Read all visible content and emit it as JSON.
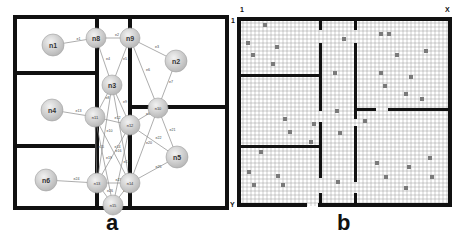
{
  "panels": [
    {
      "id": "a",
      "caption": "a",
      "type": "graph-floorplan",
      "nodes": [
        {
          "id": "n1",
          "label": "n1",
          "x": 53,
          "y": 45,
          "r": 11
        },
        {
          "id": "d1",
          "label": "n8",
          "x": 96,
          "y": 38,
          "r": 10
        },
        {
          "id": "d2",
          "label": "n9",
          "x": 130,
          "y": 38,
          "r": 10
        },
        {
          "id": "n2",
          "label": "n2",
          "x": 176,
          "y": 61,
          "r": 11
        },
        {
          "id": "n3",
          "label": "n3",
          "x": 112,
          "y": 85,
          "r": 10
        },
        {
          "id": "n4",
          "label": "n4",
          "x": 52,
          "y": 110,
          "r": 11
        },
        {
          "id": "d3",
          "label": "n11",
          "x": 95,
          "y": 117,
          "r": 10
        },
        {
          "id": "d4",
          "label": "n12",
          "x": 130,
          "y": 125,
          "r": 10
        },
        {
          "id": "d5",
          "label": "n10",
          "x": 158,
          "y": 108,
          "r": 10
        },
        {
          "id": "n5",
          "label": "n5",
          "x": 177,
          "y": 157,
          "r": 11
        },
        {
          "id": "n6",
          "label": "n6",
          "x": 46,
          "y": 180,
          "r": 11
        },
        {
          "id": "d6",
          "label": "n13",
          "x": 97,
          "y": 183,
          "r": 10
        },
        {
          "id": "d7",
          "label": "n14",
          "x": 130,
          "y": 183,
          "r": 10
        },
        {
          "id": "d8",
          "label": "n15",
          "x": 113,
          "y": 205,
          "r": 10
        }
      ],
      "edges": [
        {
          "from": "n1",
          "to": "d1",
          "label": "e1"
        },
        {
          "from": "d1",
          "to": "d2",
          "label": "e2"
        },
        {
          "from": "d2",
          "to": "n2",
          "label": "e3"
        },
        {
          "from": "d1",
          "to": "n3",
          "label": "e4"
        },
        {
          "from": "d2",
          "to": "n3",
          "label": "e5"
        },
        {
          "from": "d2",
          "to": "d5",
          "label": "e6"
        },
        {
          "from": "n2",
          "to": "d5",
          "label": "e7"
        },
        {
          "from": "n3",
          "to": "d3",
          "label": "e8"
        },
        {
          "from": "n3",
          "to": "d4",
          "label": "e9"
        },
        {
          "from": "n3",
          "to": "d6",
          "label": "e10"
        },
        {
          "from": "n3",
          "to": "d7",
          "label": "e11"
        },
        {
          "from": "d3",
          "to": "d4",
          "label": "e12"
        },
        {
          "from": "n4",
          "to": "d3",
          "label": "e13"
        },
        {
          "from": "d3",
          "to": "d7",
          "label": "e14"
        },
        {
          "from": "d3",
          "to": "d6",
          "label": "e15"
        },
        {
          "from": "d4",
          "to": "d6",
          "label": "e16"
        },
        {
          "from": "d4",
          "to": "d8",
          "label": "e17"
        },
        {
          "from": "d5",
          "to": "d4",
          "label": "e18"
        },
        {
          "from": "d5",
          "to": "n5",
          "label": "e21"
        },
        {
          "from": "d5",
          "to": "d7",
          "label": "e20"
        },
        {
          "from": "d4",
          "to": "n5",
          "label": "e22"
        },
        {
          "from": "d3",
          "to": "d8",
          "label": "e19"
        },
        {
          "from": "n6",
          "to": "d6",
          "label": "e24"
        },
        {
          "from": "d6",
          "to": "d7",
          "label": "e23"
        },
        {
          "from": "n5",
          "to": "d7",
          "label": "e25"
        },
        {
          "from": "d6",
          "to": "d8",
          "label": "e26"
        },
        {
          "from": "d7",
          "to": "d8",
          "label": "e27"
        }
      ],
      "walls": [
        {
          "x1": 15,
          "y1": 17,
          "x2": 227,
          "y2": 17
        },
        {
          "x1": 227,
          "y1": 17,
          "x2": 227,
          "y2": 208
        },
        {
          "x1": 15,
          "y1": 208,
          "x2": 227,
          "y2": 208
        },
        {
          "x1": 15,
          "y1": 17,
          "x2": 15,
          "y2": 208
        },
        {
          "x1": 97,
          "y1": 17,
          "x2": 97,
          "y2": 27
        },
        {
          "x1": 97,
          "y1": 48,
          "x2": 97,
          "y2": 106
        },
        {
          "x1": 97,
          "y1": 128,
          "x2": 97,
          "y2": 172
        },
        {
          "x1": 97,
          "y1": 194,
          "x2": 97,
          "y2": 208
        },
        {
          "x1": 130,
          "y1": 17,
          "x2": 130,
          "y2": 27
        },
        {
          "x1": 130,
          "y1": 48,
          "x2": 130,
          "y2": 114
        },
        {
          "x1": 130,
          "y1": 136,
          "x2": 130,
          "y2": 172
        },
        {
          "x1": 130,
          "y1": 194,
          "x2": 130,
          "y2": 208
        },
        {
          "x1": 15,
          "y1": 73,
          "x2": 97,
          "y2": 73
        },
        {
          "x1": 15,
          "y1": 146,
          "x2": 97,
          "y2": 146
        },
        {
          "x1": 130,
          "y1": 107,
          "x2": 148,
          "y2": 107
        },
        {
          "x1": 168,
          "y1": 107,
          "x2": 227,
          "y2": 107
        }
      ]
    },
    {
      "id": "b",
      "caption": "b",
      "type": "occupancy-grid",
      "axis_labels": {
        "origin_x": "1",
        "origin_y": "1",
        "x_max": "X",
        "y_max": "Y"
      },
      "grid": {
        "x0": 239,
        "y0": 19,
        "x1": 450,
        "y1": 206,
        "cell": 4
      },
      "walls": [
        {
          "x": 237,
          "y": 17,
          "w": 215,
          "h": 4
        },
        {
          "x": 237,
          "y": 203,
          "w": 70,
          "h": 4
        },
        {
          "x": 318,
          "y": 203,
          "w": 134,
          "h": 4
        },
        {
          "x": 237,
          "y": 17,
          "w": 4,
          "h": 190
        },
        {
          "x": 448,
          "y": 17,
          "w": 4,
          "h": 190
        },
        {
          "x": 319,
          "y": 17,
          "w": 3,
          "h": 13
        },
        {
          "x": 319,
          "y": 43,
          "w": 3,
          "h": 68
        },
        {
          "x": 319,
          "y": 122,
          "w": 3,
          "h": 56
        },
        {
          "x": 319,
          "y": 193,
          "w": 3,
          "h": 13
        },
        {
          "x": 354,
          "y": 17,
          "w": 3,
          "h": 13
        },
        {
          "x": 354,
          "y": 43,
          "w": 3,
          "h": 76
        },
        {
          "x": 354,
          "y": 126,
          "w": 3,
          "h": 56
        },
        {
          "x": 354,
          "y": 193,
          "w": 3,
          "h": 13
        },
        {
          "x": 237,
          "y": 74,
          "w": 84,
          "h": 3
        },
        {
          "x": 237,
          "y": 145,
          "w": 84,
          "h": 3
        },
        {
          "x": 354,
          "y": 108,
          "w": 22,
          "h": 3
        },
        {
          "x": 388,
          "y": 108,
          "w": 64,
          "h": 3
        }
      ],
      "occupied_cells": [
        [
          263,
          23
        ],
        [
          246,
          41
        ],
        [
          275,
          45
        ],
        [
          251,
          53
        ],
        [
          271,
          62
        ],
        [
          342,
          37
        ],
        [
          379,
          32
        ],
        [
          387,
          32
        ],
        [
          395,
          53
        ],
        [
          424,
          49
        ],
        [
          333,
          71
        ],
        [
          379,
          71
        ],
        [
          409,
          75
        ],
        [
          383,
          84
        ],
        [
          404,
          92
        ],
        [
          420,
          97
        ],
        [
          335,
          109
        ],
        [
          283,
          117
        ],
        [
          312,
          122
        ],
        [
          288,
          130
        ],
        [
          309,
          140
        ],
        [
          259,
          150
        ],
        [
          338,
          131
        ],
        [
          363,
          119
        ],
        [
          281,
          183
        ],
        [
          375,
          161
        ],
        [
          407,
          165
        ],
        [
          428,
          156
        ],
        [
          247,
          170
        ],
        [
          276,
          174
        ],
        [
          252,
          183
        ],
        [
          384,
          175
        ],
        [
          404,
          186
        ],
        [
          430,
          175
        ],
        [
          336,
          180
        ]
      ]
    }
  ]
}
